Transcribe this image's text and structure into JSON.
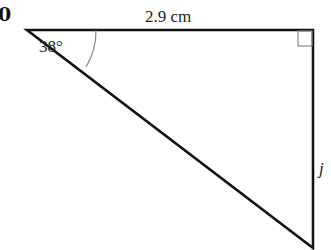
{
  "question_number": "0",
  "diagram": {
    "type": "right-triangle",
    "angle_label": "38°",
    "top_side_label": "2.9 cm",
    "right_side_label": "j",
    "right_angle_marker": true,
    "colors": {
      "stroke": "#111111",
      "arc": "#888888",
      "marker": "#888888"
    }
  }
}
